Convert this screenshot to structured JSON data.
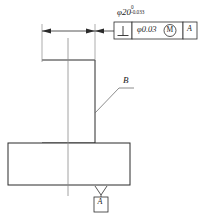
{
  "drawing": {
    "title": "Perpendicularity tolerance detail",
    "background_color": "#ffffff",
    "line_color": "#2b2b2b",
    "thin_line_color": "#8a8a8a",
    "dimension": {
      "symbol": "φ20",
      "nominal": "φ20",
      "upper_deviation": "0",
      "lower_deviation": "-0.033",
      "full_text": "φ20 0/-0.033"
    },
    "feature_control_frame": {
      "characteristic_symbol": "perpendicularity",
      "tolerance_value": "φ0.03",
      "material_condition_modifier": "M",
      "datum_reference": "A"
    },
    "labels": {
      "surface_label_b": "B",
      "datum_feature_a": "A"
    }
  }
}
